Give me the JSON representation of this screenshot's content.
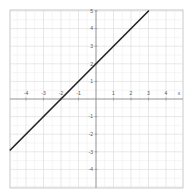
{
  "chart_data": {
    "type": "line",
    "title": "",
    "xlabel": "x",
    "ylabel": "",
    "xlim": [
      -4.9,
      5
    ],
    "ylim": [
      -5,
      5.1
    ],
    "grid": true,
    "x_ticks": [
      -4,
      -3,
      -2,
      -1,
      1,
      2,
      3,
      4
    ],
    "y_ticks": [
      5,
      4,
      3,
      2,
      1,
      -1,
      -2,
      -3,
      -4
    ],
    "x_tick_labels": [
      "-4",
      "-3",
      "-2",
      "-1",
      "1",
      "2",
      "3",
      "4"
    ],
    "y_tick_labels": [
      "5",
      "4",
      "3",
      "2",
      "1",
      "-1",
      "-2",
      "-3",
      "-4"
    ],
    "x_axis_label": "x",
    "series": [
      {
        "name": "y = x + 2",
        "equation": "y = x + 2",
        "color": "#222222",
        "x": [
          -4.9,
          3
        ],
        "y": [
          -2.9,
          5
        ]
      }
    ],
    "legend": null
  },
  "colors": {
    "background": "#ffffff",
    "grid_major": "#d8d8d8",
    "grid_minor": "#eeeeee",
    "axis": "#888888",
    "frame": "#bbbbbb",
    "line": "#222222"
  }
}
